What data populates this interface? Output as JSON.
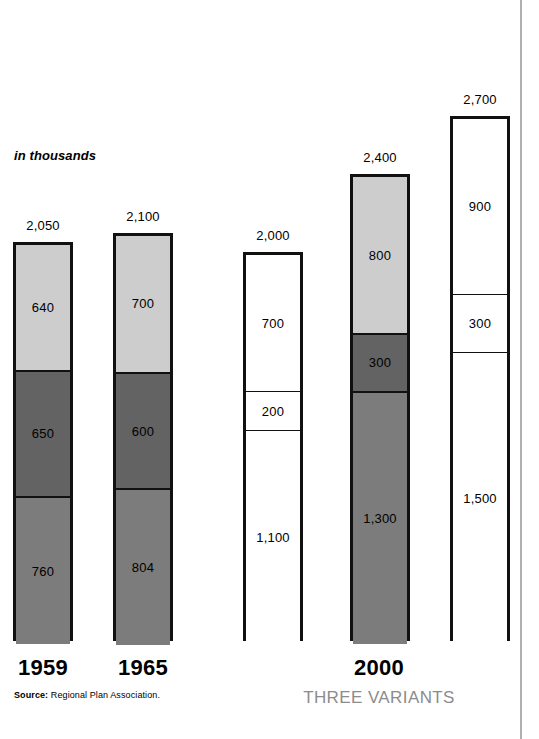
{
  "chart_data": {
    "type": "bar",
    "subtype": "stacked-column",
    "title": "",
    "unit_note": "in thousands",
    "xlabel": "",
    "ylabel": "",
    "ylim": [
      0,
      2700
    ],
    "grid": false,
    "legend": null,
    "categories": [
      "1959",
      "1965",
      "2000",
      "2000",
      "2000"
    ],
    "category_labels_shown": [
      "1959",
      "1965",
      "2000"
    ],
    "group_sublabel": "THREE VARIANTS",
    "source": {
      "key": "Source:",
      "text": "Regional Plan Association."
    },
    "segment_colors": {
      "light": "#cdcdcd",
      "dark": "#636363",
      "medium": "#7c7c7c",
      "white": "#ffffff",
      "outline": "#111111",
      "variant_label": "#8c8c8c",
      "page_rule": "#b0b0b0"
    },
    "bars": [
      {
        "name": "1959",
        "total": 2050,
        "total_label": "2,050",
        "segments": [
          {
            "value": 640,
            "label": "640",
            "fill": "light"
          },
          {
            "value": 650,
            "label": "650",
            "fill": "dark"
          },
          {
            "value": 760,
            "label": "760",
            "fill": "medium"
          }
        ]
      },
      {
        "name": "1965",
        "total": 2100,
        "total_label": "2,100",
        "segments": [
          {
            "value": 700,
            "label": "700",
            "fill": "light"
          },
          {
            "value": 600,
            "label": "600",
            "fill": "dark"
          },
          {
            "value": 804,
            "label": "804",
            "fill": "medium"
          }
        ]
      },
      {
        "name": "2000-variant-1",
        "total": 2000,
        "total_label": "2,000",
        "segments": [
          {
            "value": 700,
            "label": "700",
            "fill": "white"
          },
          {
            "value": 200,
            "label": "200",
            "fill": "white"
          },
          {
            "value": 1100,
            "label": "1,100",
            "fill": "white"
          }
        ]
      },
      {
        "name": "2000-variant-2",
        "total": 2400,
        "total_label": "2,400",
        "segments": [
          {
            "value": 800,
            "label": "800",
            "fill": "light"
          },
          {
            "value": 300,
            "label": "300",
            "fill": "dark"
          },
          {
            "value": 1300,
            "label": "1,300",
            "fill": "medium"
          }
        ]
      },
      {
        "name": "2000-variant-3",
        "total": 2700,
        "total_label": "2,700",
        "segments": [
          {
            "value": 900,
            "label": "900",
            "fill": "white"
          },
          {
            "value": 300,
            "label": "300",
            "fill": "white"
          },
          {
            "value": 1500,
            "label": "1,500",
            "fill": "white"
          }
        ]
      }
    ]
  },
  "layout": {
    "bar_left_px": [
      13,
      113,
      243,
      350,
      450
    ],
    "bar_width_px": 60,
    "baseline_y_px": 641,
    "px_per_thousand": 194.5,
    "cat_label_centers_px": [
      43,
      143,
      379
    ]
  }
}
